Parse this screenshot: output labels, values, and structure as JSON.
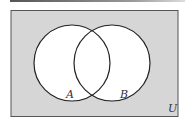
{
  "diagram": {
    "type": "venn",
    "universe_label": "U",
    "sets": [
      {
        "label": "A"
      },
      {
        "label": "B"
      }
    ],
    "shaded_region": "complement of A union B",
    "colors": {
      "shade": "#d6d6d6",
      "outline": "#222222",
      "circle_fill": "#ffffff"
    }
  }
}
